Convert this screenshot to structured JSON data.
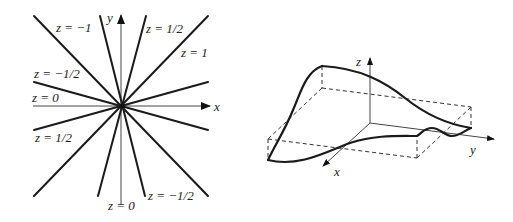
{
  "figures": [
    {
      "id": "level-curves",
      "description": "Level curves through origin",
      "axes": {
        "x_label": "x",
        "y_label": "y"
      },
      "labels": [
        {
          "text": "z = −1"
        },
        {
          "text": "z = 1/2"
        },
        {
          "text": "z = 1"
        },
        {
          "text": "z = −1/2"
        },
        {
          "text": "z = 0"
        },
        {
          "text": "z = 1/2"
        },
        {
          "text": "z = 0"
        },
        {
          "text": "z = −1/2"
        }
      ]
    },
    {
      "id": "surface-graph",
      "description": "3D surface graph",
      "axes": {
        "x_label": "x",
        "y_label": "y",
        "z_label": "z"
      }
    }
  ]
}
